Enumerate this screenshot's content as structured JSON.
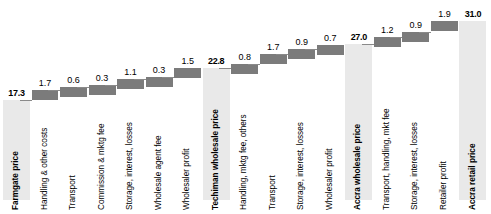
{
  "chart_data": {
    "type": "bar",
    "title": "",
    "subtitle": "",
    "xlabel": "",
    "ylabel": "",
    "ylim": [
      0,
      31.0
    ],
    "grid": false,
    "legend": false,
    "chart_style": "waterfall",
    "categories": [
      "Farmgate price",
      "Handling & other costs",
      "Transport",
      "Commission & mktg fee",
      "Storage, interest, losses",
      "Wholesale agent fee",
      "Wholesaler profit",
      "Techiman wholesale price",
      "Handling, mktg fee, others",
      "Transport",
      "Storage, interest, losses",
      "Wholesaler profit",
      "Accra wholesale price",
      "Transport, handling, mkt fee",
      "Storage, interest, losses",
      "Retailer profit",
      "Accra retail price"
    ],
    "values": [
      17.3,
      1.7,
      0.6,
      0.3,
      1.1,
      0.3,
      1.5,
      22.8,
      0.8,
      1.7,
      0.9,
      0.7,
      27.0,
      1.2,
      0.9,
      1.9,
      31.0
    ],
    "value_labels": [
      "17.3",
      "1.7",
      "0.6",
      "0.3",
      "1.1",
      "0.3",
      "1.5",
      "22.8",
      "0.8",
      "1.7",
      "0.9",
      "0.7",
      "27.0",
      "1.2",
      "0.9",
      "1.9",
      "31.0"
    ],
    "bar_kinds": [
      "total",
      "delta",
      "delta",
      "delta",
      "delta",
      "delta",
      "delta",
      "total",
      "delta",
      "delta",
      "delta",
      "delta",
      "total",
      "delta",
      "delta",
      "delta",
      "total"
    ],
    "cumulative_base": [
      0,
      17.3,
      19.0,
      19.6,
      19.9,
      21.0,
      21.3,
      0,
      22.8,
      23.6,
      25.3,
      26.2,
      0,
      27.0,
      28.2,
      29.1,
      0
    ],
    "cumulative_top": [
      17.3,
      19.0,
      19.6,
      19.9,
      21.0,
      21.3,
      22.8,
      22.8,
      23.6,
      25.3,
      26.2,
      26.9,
      27.0,
      28.2,
      29.1,
      31.0,
      31.0
    ],
    "colors": {
      "total_bar": "#e9e9e9",
      "delta_bar": "#7b7b7b",
      "connector": "#8a8a8a",
      "text": "#000000",
      "background": "#ffffff"
    }
  },
  "bars": [
    {
      "label": "Farmgate price",
      "value": "17.3",
      "kind": "total"
    },
    {
      "label": "Handling & other costs",
      "value": "1.7",
      "kind": "delta"
    },
    {
      "label": "Transport",
      "value": "0.6",
      "kind": "delta"
    },
    {
      "label": "Commission & mktg fee",
      "value": "0.3",
      "kind": "delta"
    },
    {
      "label": "Storage, interest, losses",
      "value": "1.1",
      "kind": "delta"
    },
    {
      "label": "Wholesale agent fee",
      "value": "0.3",
      "kind": "delta"
    },
    {
      "label": "Wholesaler profit",
      "value": "1.5",
      "kind": "delta"
    },
    {
      "label": "Techiman wholesale price",
      "value": "22.8",
      "kind": "total"
    },
    {
      "label": "Handling, mktg fee, others",
      "value": "0.8",
      "kind": "delta"
    },
    {
      "label": "Transport",
      "value": "1.7",
      "kind": "delta"
    },
    {
      "label": "Storage, interest, losses",
      "value": "0.9",
      "kind": "delta"
    },
    {
      "label": "Wholesaler profit",
      "value": "0.7",
      "kind": "delta"
    },
    {
      "label": "Accra wholesale price",
      "value": "27.0",
      "kind": "total"
    },
    {
      "label": "Transport, handling, mkt fee",
      "value": "1.2",
      "kind": "delta"
    },
    {
      "label": "Storage, interest, losses",
      "value": "0.9",
      "kind": "delta"
    },
    {
      "label": "Retailer profit",
      "value": "1.9",
      "kind": "delta"
    },
    {
      "label": "Accra retail price",
      "value": "31.0",
      "kind": "total"
    }
  ]
}
